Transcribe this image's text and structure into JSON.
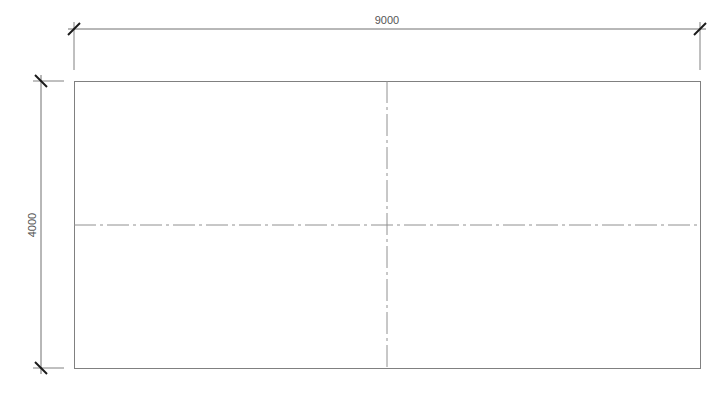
{
  "drawing": {
    "type": "plan-dimension-drawing",
    "colors": {
      "background": "#ffffff",
      "outline": "#808080",
      "dimension_line": "#707070",
      "tick": "#1a1a1a",
      "center_line": "#909090",
      "text": "#555555"
    },
    "dimensions": {
      "width_label": "9000",
      "height_label": "4000"
    },
    "rectangle": {
      "divisions_x": 2,
      "divisions_y": 2
    },
    "center_lines": [
      "vertical",
      "horizontal"
    ]
  }
}
